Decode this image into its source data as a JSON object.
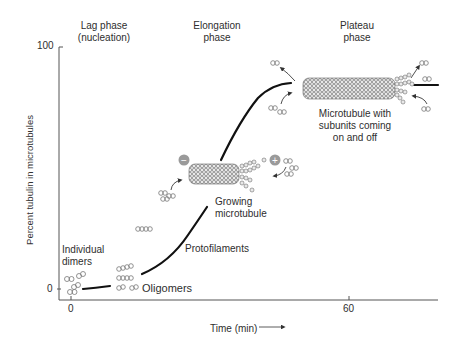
{
  "phases": [
    {
      "line1": "Lag phase",
      "line2": "(nucleation)"
    },
    {
      "line1": "Elongation",
      "line2": "phase"
    },
    {
      "line1": "Plateau",
      "line2": "phase"
    }
  ],
  "axes": {
    "ylabel": "Percent tubulin in microtubules",
    "y_ticks": [
      "100",
      "0"
    ],
    "x_ticks": [
      "0",
      "60"
    ],
    "xlabel": "Time (min)"
  },
  "annotations": {
    "individual_dimers": [
      "Individual",
      "dimers"
    ],
    "oligomers": "Oligomers",
    "protofilaments": "Protofilaments",
    "growing_microtubule": [
      "Growing",
      "microtubule"
    ],
    "plateau_microtubule": [
      "Microtubule with",
      "subunits coming",
      "on and off"
    ],
    "minus_symbol": "−",
    "plus_symbol": "+"
  },
  "colors": {
    "curve": "#111111",
    "axis": "#555555",
    "subunit_fill": "#e6e6e6",
    "subunit_stroke": "#777777",
    "end_marker": "#9a9a9a"
  }
}
